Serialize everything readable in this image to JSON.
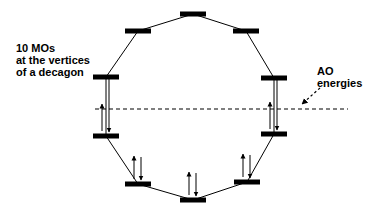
{
  "diagram": {
    "title_lines": [
      "10 MOs",
      "at the vertices",
      "of a decagon"
    ],
    "annotation_lines": [
      "AO",
      "energies"
    ],
    "shape": "decagon",
    "mo_count": 10,
    "colors": {
      "line": "#000000",
      "bar": "#000000",
      "background": "#ffffff"
    },
    "orbitals": [
      {
        "id": "mo-1",
        "level": 1,
        "electrons": 2
      },
      {
        "id": "mo-2a",
        "level": 2,
        "electrons": 2
      },
      {
        "id": "mo-2b",
        "level": 2,
        "electrons": 2
      },
      {
        "id": "mo-3a",
        "level": 3,
        "electrons": 2
      },
      {
        "id": "mo-3b",
        "level": 3,
        "electrons": 2
      },
      {
        "id": "mo-4a",
        "level": 4,
        "electrons": 0
      },
      {
        "id": "mo-4b",
        "level": 4,
        "electrons": 0
      },
      {
        "id": "mo-5a",
        "level": 5,
        "electrons": 0
      },
      {
        "id": "mo-5b",
        "level": 5,
        "electrons": 0
      },
      {
        "id": "mo-6",
        "level": 6,
        "electrons": 0
      }
    ],
    "reference_line": "AO energy level (dashed)"
  }
}
